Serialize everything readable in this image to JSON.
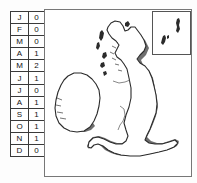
{
  "figure": {
    "type": "map-with-frequency-table",
    "region": "British Isles"
  },
  "month_table": {
    "rows": [
      {
        "month": "J",
        "value": "0"
      },
      {
        "month": "F",
        "value": "0"
      },
      {
        "month": "M",
        "value": "0"
      },
      {
        "month": "A",
        "value": "1"
      },
      {
        "month": "M",
        "value": "2"
      },
      {
        "month": "J",
        "value": "1"
      },
      {
        "month": "J",
        "value": "0"
      },
      {
        "month": "A",
        "value": "1"
      },
      {
        "month": "S",
        "value": "1"
      },
      {
        "month": "O",
        "value": "1"
      },
      {
        "month": "N",
        "value": "1"
      },
      {
        "month": "D",
        "value": "0"
      }
    ]
  },
  "map": {
    "landmasses": [
      "Great Britain",
      "Ireland",
      "Hebrides",
      "Orkney"
    ],
    "inset": {
      "label": "",
      "landmasses": [
        "Shetland Mainland",
        "Shetland southern isles"
      ]
    }
  },
  "colors": {
    "coastline": "#2b2b2b",
    "shadow": "#6f6f6f",
    "land": "#ffffff",
    "frame": "#777777",
    "table_border": "#3a3a3a"
  }
}
